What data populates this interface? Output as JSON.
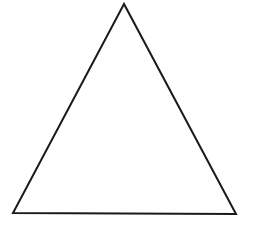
{
  "diagram": {
    "shape": "triangle",
    "type": "equilateral-outline",
    "stroke_color": "#1a1a1a",
    "fill_color": "#ffffff",
    "stroke_width": 2,
    "vertices": {
      "apex": [
        124,
        4
      ],
      "bottom_left": [
        13,
        213
      ],
      "bottom_right": [
        236,
        214
      ]
    }
  }
}
